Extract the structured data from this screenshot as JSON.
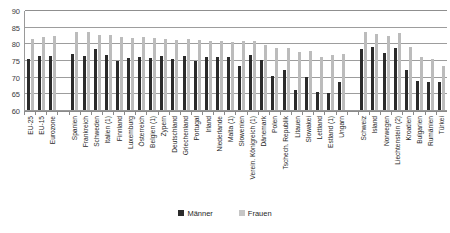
{
  "chart_data": {
    "type": "bar",
    "title": "",
    "xlabel": "",
    "ylabel": "",
    "ylim": [
      60,
      90
    ],
    "yticks": [
      90,
      85,
      80,
      75,
      70,
      65,
      60
    ],
    "grid": true,
    "legend_position": "bottom",
    "categories": [
      "EU-25",
      "EU-15",
      "Eurozone",
      "",
      "Spanien",
      "Frankreich",
      "Schweden",
      "Italien (1)",
      "Finnland",
      "Luxemburg",
      "Österreich",
      "Belgien (1)",
      "Zypern",
      "Deutschland",
      "Griechenland",
      "Portugal",
      "Irland",
      "Niederlande",
      "Malta (1)",
      "Slowenien",
      "Verein. Königreich (1)",
      "Dänemark",
      "Polen",
      "Tschech. Republik",
      "Litauen",
      "Slowakei",
      "Lettland",
      "Estland (1)",
      "Ungarn",
      "",
      "Schweiz",
      "Island",
      "Norwegen",
      "Liechtenstein (2)",
      "Kroatien",
      "Bulgarien",
      "Rumänien",
      "Türkei"
    ],
    "series": [
      {
        "name": "Männer",
        "color": "#2b2b2b",
        "values": [
          75.5,
          76.4,
          76.6,
          null,
          77.0,
          76.6,
          78.5,
          76.7,
          75.1,
          76.0,
          76.2,
          76.0,
          76.4,
          75.7,
          76.6,
          74.9,
          76.2,
          76.3,
          76.1,
          73.5,
          76.7,
          75.2,
          70.5,
          72.4,
          66.3,
          70.1,
          65.6,
          65.3,
          68.6,
          null,
          78.6,
          79.2,
          77.5,
          79.0,
          72.3,
          69.0,
          68.7,
          68.8
        ]
      },
      {
        "name": "Frauen",
        "color": "#bcbcbc",
        "values": [
          81.7,
          82.2,
          82.4,
          null,
          83.7,
          83.8,
          82.7,
          82.8,
          82.3,
          81.9,
          82.1,
          81.9,
          81.5,
          81.4,
          81.5,
          81.4,
          81.1,
          81.0,
          80.8,
          81.1,
          81.0,
          79.9,
          79.0,
          79.0,
          77.7,
          77.9,
          76.2,
          76.8,
          77.2,
          null,
          83.7,
          83.0,
          82.5,
          83.3,
          79.3,
          76.2,
          75.7,
          73.6
        ]
      }
    ]
  },
  "legend": {
    "items": [
      {
        "label": "Männer"
      },
      {
        "label": "Frauen"
      }
    ]
  },
  "fragments": {
    "top_cut": "",
    "bottom_cut": ""
  }
}
